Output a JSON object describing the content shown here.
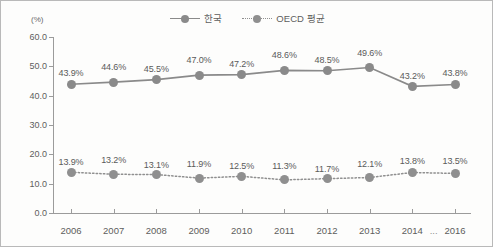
{
  "unit_label": "(%)",
  "legend": {
    "items": [
      {
        "label": "한국",
        "style": "solid",
        "color": "#8a8a8a"
      },
      {
        "label": "OECD 평균",
        "style": "dotted",
        "color": "#8f8f8f"
      }
    ]
  },
  "axis": {
    "y_ticks": [
      "0.0",
      "10.0",
      "20.0",
      "30.0",
      "40.0",
      "50.0",
      "60.0"
    ],
    "x_ticks": [
      "2006",
      "2007",
      "2008",
      "2009",
      "2010",
      "2011",
      "2012",
      "2013",
      "2014",
      "2016"
    ],
    "x_ellipsis": "..."
  },
  "chart_data": {
    "type": "line",
    "title": "",
    "subtitle": "",
    "xlabel": "",
    "ylabel": "(%)",
    "ylim": [
      0,
      60
    ],
    "ytick_step": 10,
    "grid": false,
    "legend_position": "top-center",
    "categories": [
      "2006",
      "2007",
      "2008",
      "2009",
      "2010",
      "2011",
      "2012",
      "2013",
      "2014",
      "2016"
    ],
    "series": [
      {
        "name": "한국",
        "line_style": "solid",
        "color": "#8a8a8a",
        "values": [
          43.9,
          44.6,
          45.5,
          47.0,
          47.2,
          48.6,
          48.5,
          49.6,
          43.2,
          43.8
        ],
        "labels": [
          "43.9%",
          "44.6%",
          "45.5%",
          "47.0%",
          "47.2%",
          "48.6%",
          "48.5%",
          "49.6%",
          "43.2%",
          "43.8%"
        ]
      },
      {
        "name": "OECD 평균",
        "line_style": "dotted",
        "color": "#8f8f8f",
        "values": [
          13.9,
          13.2,
          13.1,
          11.9,
          12.5,
          11.3,
          11.7,
          12.1,
          13.8,
          13.5
        ],
        "labels": [
          "13.9%",
          "13.2%",
          "13.1%",
          "11.9%",
          "12.5%",
          "11.3%",
          "11.7%",
          "12.1%",
          "13.8%",
          "13.5%"
        ]
      }
    ],
    "annotations": [
      {
        "text": "...",
        "position": "x-axis between 2014 and 2016"
      }
    ]
  }
}
